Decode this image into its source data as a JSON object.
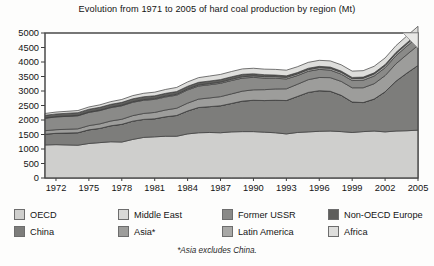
{
  "chart_data": {
    "type": "area",
    "stacked": true,
    "title": "Evolution from 1971 to 2005 of hard coal production by region (Mt)",
    "footnote": "*Asia excludes China.",
    "xlabel": "",
    "ylabel": "",
    "unit": "Mt",
    "grid": false,
    "legend_position": "bottom",
    "xlim": [
      1971,
      2005
    ],
    "ylim": [
      0,
      5000
    ],
    "yticks": [
      0,
      500,
      1000,
      1500,
      2000,
      2500,
      3000,
      3500,
      4000,
      4500,
      5000
    ],
    "ytick_labels": [
      "0",
      "500",
      "1000",
      "1500",
      "2000",
      "2500",
      "3000",
      "3500",
      "4000",
      "4500",
      "5000"
    ],
    "xticks": [
      1972,
      1975,
      1978,
      1981,
      1984,
      1987,
      1990,
      1993,
      1996,
      1999,
      2002,
      2005
    ],
    "xtick_labels": [
      "1972",
      "1975",
      "1978",
      "1981",
      "1984",
      "1987",
      "1990",
      "1993",
      "1996",
      "1999",
      "2002",
      "2005"
    ],
    "x": [
      1971,
      1972,
      1973,
      1974,
      1975,
      1976,
      1977,
      1978,
      1979,
      1980,
      1981,
      1982,
      1983,
      1984,
      1985,
      1986,
      1987,
      1988,
      1989,
      1990,
      1991,
      1992,
      1993,
      1994,
      1995,
      1996,
      1997,
      1998,
      1999,
      2000,
      2001,
      2002,
      2003,
      2004,
      2005
    ],
    "series": [
      {
        "name": "OECD",
        "color": "#cfcfcd",
        "values": [
          1140,
          1150,
          1140,
          1130,
          1190,
          1220,
          1250,
          1240,
          1330,
          1400,
          1420,
          1440,
          1440,
          1520,
          1560,
          1570,
          1560,
          1590,
          1600,
          1600,
          1580,
          1560,
          1520,
          1570,
          1590,
          1610,
          1620,
          1600,
          1570,
          1600,
          1620,
          1590,
          1620,
          1630,
          1650
        ]
      },
      {
        "name": "China",
        "color": "#7d7d7b",
        "values": [
          370,
          390,
          410,
          430,
          470,
          490,
          550,
          610,
          630,
          620,
          620,
          670,
          715,
          790,
          870,
          890,
          930,
          980,
          1050,
          1080,
          1090,
          1120,
          1150,
          1240,
          1360,
          1400,
          1370,
          1250,
          1050,
          1000,
          1100,
          1380,
          1720,
          1990,
          2230
        ]
      },
      {
        "name": "Middle East",
        "color": "#d9d9d7",
        "values": [
          1,
          1,
          1,
          1,
          1,
          1,
          1,
          1,
          1,
          1,
          1,
          1,
          1,
          1,
          1,
          1,
          1,
          1,
          1,
          1,
          1,
          1,
          1,
          1,
          1,
          1,
          1,
          1,
          1,
          1,
          1,
          1,
          1,
          1,
          1
        ]
      },
      {
        "name": "Asia*",
        "color": "#9d9d9b",
        "values": [
          120,
          125,
          130,
          135,
          145,
          155,
          165,
          175,
          190,
          205,
          220,
          235,
          250,
          270,
          290,
          300,
          315,
          330,
          345,
          360,
          375,
          390,
          405,
          420,
          440,
          455,
          470,
          480,
          490,
          510,
          530,
          560,
          600,
          640,
          690
        ]
      },
      {
        "name": "Former USSR",
        "color": "#8a8a88",
        "values": [
          430,
          440,
          445,
          450,
          455,
          460,
          460,
          465,
          460,
          455,
          450,
          450,
          450,
          455,
          450,
          455,
          460,
          460,
          450,
          430,
          400,
          370,
          340,
          300,
          290,
          280,
          260,
          250,
          250,
          260,
          265,
          270,
          280,
          290,
          300
        ]
      },
      {
        "name": "Latin America",
        "color": "#a8a8a6",
        "values": [
          12,
          13,
          14,
          15,
          16,
          17,
          19,
          20,
          22,
          24,
          26,
          28,
          30,
          33,
          36,
          38,
          40,
          43,
          46,
          48,
          50,
          52,
          54,
          56,
          58,
          60,
          62,
          64,
          66,
          68,
          70,
          72,
          75,
          78,
          82
        ]
      },
      {
        "name": "Non-OECD Europe",
        "color": "#5e5e5c",
        "values": [
          90,
          90,
          92,
          93,
          94,
          95,
          96,
          97,
          98,
          98,
          97,
          96,
          95,
          94,
          92,
          90,
          88,
          86,
          84,
          75,
          66,
          58,
          52,
          48,
          45,
          44,
          43,
          42,
          41,
          40,
          40,
          39,
          39,
          38,
          38
        ]
      },
      {
        "name": "Africa",
        "color": "#dededc",
        "values": [
          62,
          65,
          68,
          72,
          78,
          85,
          92,
          100,
          110,
          118,
          126,
          134,
          142,
          150,
          162,
          172,
          178,
          182,
          186,
          190,
          192,
          194,
          196,
          200,
          204,
          208,
          212,
          216,
          218,
          222,
          226,
          228,
          232,
          236,
          240
        ]
      }
    ],
    "legend_entries": [
      {
        "label": "OECD",
        "color": "#cfcfcd"
      },
      {
        "label": "Middle East",
        "color": "#d9d9d7"
      },
      {
        "label": "Former USSR",
        "color": "#8a8a88"
      },
      {
        "label": "Non-OECD Europe",
        "color": "#5e5e5c"
      },
      {
        "label": "China",
        "color": "#7d7d7b"
      },
      {
        "label": "Asia*",
        "color": "#9d9d9b"
      },
      {
        "label": "Latin America",
        "color": "#a8a8a6"
      },
      {
        "label": "Africa",
        "color": "#dededc"
      }
    ]
  }
}
